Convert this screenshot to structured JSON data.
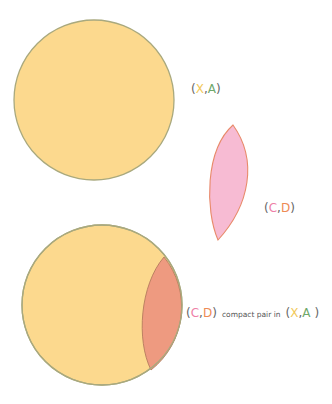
{
  "colors": {
    "space_fill": "#FCD98E",
    "space_stroke": "#A9A97E",
    "pair_fill": "#F7BBD3",
    "pair_stroke": "#E88A6A",
    "overlap_fill": "#EE9A80",
    "paren": "#666666",
    "X": "#F2C95A",
    "A": "#6FA86A",
    "C": "#EE7FA8",
    "D": "#EE8A55"
  },
  "labels": {
    "xa": {
      "open": "(",
      "x": "X",
      "comma": ",",
      "a": "A",
      "close": ")"
    },
    "cd": {
      "open": "(",
      "c": "C",
      "comma": ",",
      "d": "D",
      "close": ")"
    },
    "bottom": {
      "open1": "(",
      "c": "C",
      "comma1": ",",
      "d": "D",
      "close1": ")",
      "text": "compact pair in",
      "open2": "(",
      "x": "X",
      "comma2": ",",
      "a": "A",
      "close2": " )"
    }
  }
}
